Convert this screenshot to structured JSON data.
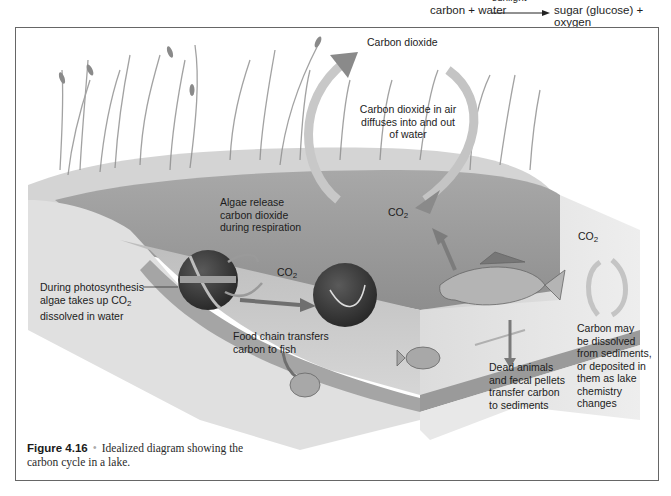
{
  "equation": {
    "lhs": "carbon + water",
    "arrow_label": "sunlight",
    "rhs": "sugar (glucose) + oxygen"
  },
  "labels": {
    "carbon_dioxide": "Carbon dioxide",
    "diffuses": [
      "Carbon dioxide in air",
      "diffuses into and out",
      "of water"
    ],
    "algae_release": [
      "Algae release",
      "carbon dioxide",
      "during respiration"
    ],
    "co2_water": "CO",
    "co2_algae": "CO",
    "co2_sediment": "CO",
    "co2_sub": "2",
    "photosynthesis": [
      "During photosynthesis",
      "algae takes up CO",
      "dissolved in water"
    ],
    "food_chain": [
      "Food chain transfers",
      "carbon to fish"
    ],
    "dead_animals": [
      "Dead animals",
      "and fecal pellets",
      "transfer carbon",
      "to sediments"
    ],
    "sediments": [
      "Carbon may",
      "be dissolved",
      "from sediments,",
      "or deposited in",
      "them as lake",
      "chemistry",
      "changes"
    ]
  },
  "caption": {
    "figure_number": "Figure 4.16",
    "separator": "•",
    "text": "Idealized diagram showing the carbon cycle in a lake."
  },
  "colors": {
    "frame": "#666666",
    "water_surface": "#9a9a9a",
    "water_side": "#c8c8c8",
    "sediment": "#e2e2e2",
    "arrow": "#8a8a8a",
    "sphere": "#3a3a3a"
  }
}
